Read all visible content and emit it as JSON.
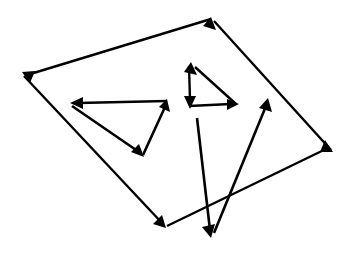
{
  "canvas": {
    "width": 351,
    "height": 255,
    "background_color": "#ffffff",
    "stroke_color": "#000000",
    "description": "Line drawing of four closed arrow-cycles: one large outer quadrilateral and three smaller triangles inside it"
  },
  "figure": {
    "title": "",
    "shape_count": 4,
    "arrow_count": 11
  },
  "shapes": [
    {
      "id": "outer-quadrilateral",
      "name": "outer-quadrilateral",
      "kind": "quadrilateral",
      "closed": true,
      "stroke_width": 2.4,
      "arrowhead_size": 11,
      "vertices": [
        {
          "label": "top",
          "x": 211,
          "y": 17
        },
        {
          "label": "left",
          "x": 22,
          "y": 72
        },
        {
          "label": "bottom",
          "x": 166,
          "y": 228
        },
        {
          "label": "right",
          "x": 333,
          "y": 152
        }
      ],
      "edges": [
        {
          "from": "right",
          "to": "top",
          "x1": 333,
          "y1": 152,
          "x2": 211,
          "y2": 17
        },
        {
          "from": "top",
          "to": "left",
          "x1": 211,
          "y1": 17,
          "x2": 22,
          "y2": 72
        },
        {
          "from": "left",
          "to": "bottom",
          "x1": 22,
          "y1": 72,
          "x2": 166,
          "y2": 228
        },
        {
          "from": "bottom",
          "to": "right",
          "x1": 166,
          "y1": 228,
          "x2": 333,
          "y2": 152
        }
      ]
    },
    {
      "id": "left-triangle",
      "name": "left-triangle",
      "kind": "triangle",
      "closed": true,
      "stroke_width": 2.6,
      "arrowhead_size": 11,
      "vertices": [
        {
          "label": "right",
          "x": 167,
          "y": 99
        },
        {
          "label": "left",
          "x": 70,
          "y": 103
        },
        {
          "label": "bottom",
          "x": 144,
          "y": 157
        }
      ],
      "edges": [
        {
          "from": "right",
          "to": "left",
          "x1": 167,
          "y1": 101,
          "x2": 70,
          "y2": 103
        },
        {
          "from": "left",
          "to": "bottom",
          "x1": 70,
          "y1": 105,
          "x2": 144,
          "y2": 157
        },
        {
          "from": "bottom",
          "to": "right",
          "x1": 144,
          "y1": 157,
          "x2": 167,
          "y2": 99
        }
      ]
    },
    {
      "id": "small-right-triangle",
      "name": "small-right-triangle",
      "kind": "triangle",
      "closed": true,
      "stroke_width": 2.4,
      "arrowhead_size": 10,
      "vertices": [
        {
          "label": "apex",
          "x": 191,
          "y": 62
        },
        {
          "label": "bottom-left",
          "x": 190,
          "y": 108
        },
        {
          "label": "bottom-right",
          "x": 239,
          "y": 104
        }
      ],
      "edges": [
        {
          "from": "bottom-right",
          "to": "apex",
          "x1": 236,
          "y1": 104,
          "x2": 191,
          "y2": 62
        },
        {
          "from": "apex",
          "to": "bottom-left",
          "x1": 189,
          "y1": 66,
          "x2": 190,
          "y2": 108
        },
        {
          "from": "bottom-left",
          "to": "bottom-right",
          "x1": 190,
          "y1": 105,
          "x2": 239,
          "y2": 104
        }
      ]
    },
    {
      "id": "narrow-v-triangle",
      "name": "narrow-v-triangle",
      "kind": "triangle",
      "closed": true,
      "stroke_width": 2.6,
      "arrowhead_size": 12,
      "vertices": [
        {
          "label": "apex",
          "x": 268,
          "y": 98
        },
        {
          "label": "bottom",
          "x": 211,
          "y": 238
        },
        {
          "label": "upper-left",
          "x": 197,
          "y": 118
        }
      ],
      "edges": [
        {
          "from": "bottom",
          "to": "apex",
          "x1": 213,
          "y1": 233,
          "x2": 268,
          "y2": 98
        },
        {
          "from": "upper-left",
          "to": "bottom",
          "x1": 197,
          "y1": 118,
          "x2": 211,
          "y2": 238
        }
      ]
    }
  ],
  "arrows": [
    {
      "name": "quad-arrow-to-top",
      "tip_x": 211,
      "tip_y": 17,
      "direction": "up-right"
    },
    {
      "name": "quad-arrow-to-left",
      "tip_x": 22,
      "tip_y": 72,
      "direction": "up-left"
    },
    {
      "name": "quad-arrow-to-bottom",
      "tip_x": 166,
      "tip_y": 228,
      "direction": "down-right"
    },
    {
      "name": "quad-arrow-to-right",
      "tip_x": 333,
      "tip_y": 152,
      "direction": "down-right"
    },
    {
      "name": "left-triangle-arrow-to-left",
      "tip_x": 70,
      "tip_y": 103,
      "direction": "left"
    },
    {
      "name": "left-triangle-arrow-to-bottom",
      "tip_x": 144,
      "tip_y": 157,
      "direction": "down-right"
    },
    {
      "name": "left-triangle-arrow-to-right",
      "tip_x": 167,
      "tip_y": 99,
      "direction": "up-right"
    },
    {
      "name": "small-triangle-arrow-to-apex",
      "tip_x": 191,
      "tip_y": 62,
      "direction": "up-left"
    },
    {
      "name": "small-triangle-arrow-to-bottom-left",
      "tip_x": 190,
      "tip_y": 108,
      "direction": "down"
    },
    {
      "name": "small-triangle-arrow-to-bottom-right",
      "tip_x": 239,
      "tip_y": 104,
      "direction": "right"
    },
    {
      "name": "v-triangle-arrow-to-apex",
      "tip_x": 268,
      "tip_y": 98,
      "direction": "up-right"
    },
    {
      "name": "v-triangle-arrow-to-bottom",
      "tip_x": 211,
      "tip_y": 238,
      "direction": "down-left"
    }
  ]
}
